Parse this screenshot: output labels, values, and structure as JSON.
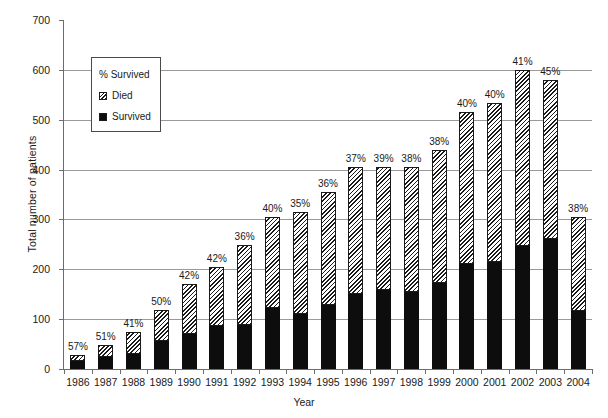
{
  "chart_data": {
    "type": "bar",
    "stacked": true,
    "title": "",
    "xlabel": "Year",
    "ylabel": "Total number of patients",
    "ylim": [
      0,
      700
    ],
    "ytick_step": 100,
    "yticks": [
      0,
      100,
      200,
      300,
      400,
      500,
      600,
      700
    ],
    "grid": "horizontal",
    "legend_position": "upper-left-inside",
    "legend_title": "% Survived",
    "categories": [
      "1986",
      "1987",
      "1988",
      "1989",
      "1990",
      "1991",
      "1992",
      "1993",
      "1994",
      "1995",
      "1996",
      "1997",
      "1998",
      "1999",
      "2000",
      "2001",
      "2002",
      "2003",
      "2004"
    ],
    "series": [
      {
        "name": "Survived",
        "values": [
          16,
          25,
          31,
          56,
          71,
          86,
          89,
          122,
          110,
          128,
          150,
          158,
          155,
          173,
          211,
          215,
          246,
          261,
          116
        ]
      },
      {
        "name": "Died",
        "values": [
          12,
          24,
          44,
          62,
          99,
          119,
          159,
          183,
          205,
          227,
          255,
          247,
          250,
          267,
          304,
          318,
          354,
          319,
          189
        ]
      }
    ],
    "totals": [
      28,
      49,
      75,
      118,
      170,
      205,
      248,
      305,
      315,
      355,
      405,
      405,
      405,
      440,
      515,
      533,
      600,
      580,
      305
    ],
    "point_labels": [
      "57%",
      "51%",
      "41%",
      "50%",
      "42%",
      "42%",
      "36%",
      "40%",
      "35%",
      "36%",
      "37%",
      "39%",
      "38%",
      "38%",
      "40%",
      "40%",
      "41%",
      "45%",
      "38%"
    ],
    "point_label_meaning": "% Survived"
  },
  "legend": {
    "title": "% Survived",
    "entries": [
      {
        "label": "Died",
        "swatch": "hatched-diagonal"
      },
      {
        "label": "Survived",
        "swatch": "solid-black"
      }
    ]
  },
  "axes": {
    "y_title": "Total number of patients",
    "x_title": "Year"
  },
  "colors": {
    "survived": "#0d0d0d",
    "died_hatch": "#1a1a1a",
    "died_background": "#ffffff",
    "gridline": "#9a9a9a",
    "axis": "#6d6d6d",
    "text": "#1a1a1a",
    "plot_background": "#ffffff"
  }
}
